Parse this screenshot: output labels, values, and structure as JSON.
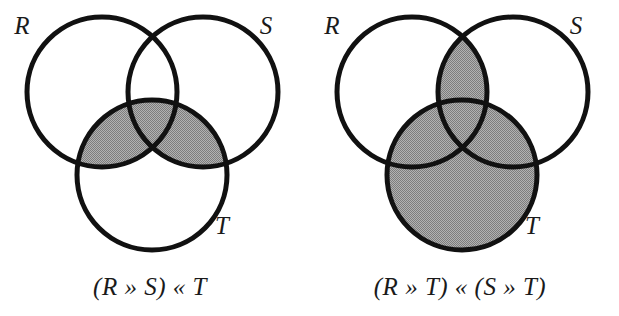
{
  "figure": {
    "background_color": "#ffffff",
    "stroke_color": "#111111",
    "shade_color": "#9a9a9a",
    "stroke_width": 5,
    "circle_radius": 75
  },
  "diagrams": [
    {
      "id": "left",
      "name": "venn-diagram-left",
      "caption": "(R » S) « T",
      "caption_parts": {
        "open_paren": "(",
        "first": "R",
        "op1": "»",
        "second": "S",
        "close_paren": ")",
        "op2": "«",
        "third": "T"
      },
      "shaded_description": "intersection of (R union S) with T",
      "circles": [
        {
          "label": "R",
          "cx": 102,
          "cy": 92,
          "r": 75,
          "label_x": 22,
          "label_y": 34
        },
        {
          "label": "S",
          "cx": 203,
          "cy": 92,
          "r": 75,
          "label_x": 266,
          "label_y": 34
        },
        {
          "label": "T",
          "cx": 152,
          "cy": 175,
          "r": 75,
          "label_x": 222,
          "label_y": 234
        }
      ]
    },
    {
      "id": "right",
      "name": "venn-diagram-right",
      "caption": "(R » T) « (S » T)",
      "caption_parts": {
        "open_paren": "(",
        "first": "R",
        "op1": "»",
        "second": "T",
        "close_paren": ")",
        "op2": "«",
        "open_paren2": "(",
        "third": "S",
        "op3": "»",
        "fourth": "T",
        "close_paren2": ")"
      },
      "shaded_description": "union of (R intersect T) and (S intersect T)",
      "circles": [
        {
          "label": "R",
          "cx": 412,
          "cy": 92,
          "r": 75,
          "label_x": 332,
          "label_y": 34
        },
        {
          "label": "S",
          "cx": 513,
          "cy": 92,
          "r": 75,
          "label_x": 576,
          "label_y": 34
        },
        {
          "label": "T",
          "cx": 462,
          "cy": 175,
          "r": 75,
          "label_x": 532,
          "label_y": 234
        }
      ]
    }
  ],
  "captions": {
    "left": "(R » S) « T",
    "right": "(R » T) « (S » T)",
    "left_x": 150,
    "left_y": 295,
    "right_x": 460,
    "right_y": 295
  }
}
